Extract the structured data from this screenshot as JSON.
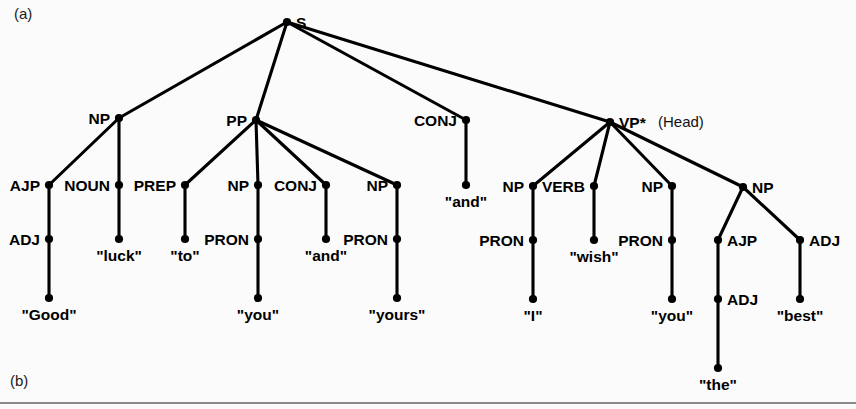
{
  "figure": {
    "panel_a_label": "(a)",
    "panel_b_label": "(b)",
    "head_annotation": "(Head)"
  },
  "tree": {
    "root": {
      "label": "S",
      "x": 287,
      "y": 22,
      "label_dx": 12,
      "label_dy": 1
    },
    "nodes": [
      {
        "id": "s",
        "label": "S",
        "x": 287,
        "y": 22,
        "side": "right"
      },
      {
        "id": "np1",
        "label": "NP",
        "x": 119,
        "y": 118,
        "side": "left"
      },
      {
        "id": "pp",
        "label": "PP",
        "x": 256,
        "y": 120,
        "side": "left"
      },
      {
        "id": "conj1",
        "label": "CONJ",
        "x": 466,
        "y": 120,
        "side": "left"
      },
      {
        "id": "vp",
        "label": "VP*",
        "x": 610,
        "y": 122,
        "side": "right"
      },
      {
        "id": "ajp1",
        "label": "AJP",
        "x": 49,
        "y": 185,
        "side": "left"
      },
      {
        "id": "noun1",
        "label": "NOUN",
        "x": 119,
        "y": 185,
        "side": "left"
      },
      {
        "id": "prep1",
        "label": "PREP",
        "x": 185,
        "y": 185,
        "side": "left"
      },
      {
        "id": "np2",
        "label": "NP",
        "x": 258,
        "y": 185,
        "side": "left"
      },
      {
        "id": "conj2",
        "label": "CONJ",
        "x": 326,
        "y": 185,
        "side": "left"
      },
      {
        "id": "np3",
        "label": "NP",
        "x": 397,
        "y": 185,
        "side": "left"
      },
      {
        "id": "np4",
        "label": "NP",
        "x": 533,
        "y": 186,
        "side": "left"
      },
      {
        "id": "verb1",
        "label": "VERB",
        "x": 594,
        "y": 186,
        "side": "left"
      },
      {
        "id": "np5",
        "label": "NP",
        "x": 672,
        "y": 186,
        "side": "left"
      },
      {
        "id": "np6",
        "label": "NP",
        "x": 743,
        "y": 187,
        "side": "right"
      },
      {
        "id": "adj1",
        "label": "ADJ",
        "x": 49,
        "y": 239,
        "side": "left"
      },
      {
        "id": "pron1",
        "label": "PRON",
        "x": 258,
        "y": 239,
        "side": "left"
      },
      {
        "id": "pron2",
        "label": "PRON",
        "x": 397,
        "y": 239,
        "side": "left"
      },
      {
        "id": "pron3",
        "label": "PRON",
        "x": 533,
        "y": 240,
        "side": "left"
      },
      {
        "id": "pron4",
        "label": "PRON",
        "x": 672,
        "y": 240,
        "side": "left"
      },
      {
        "id": "ajp2",
        "label": "AJP",
        "x": 718,
        "y": 240,
        "side": "right"
      },
      {
        "id": "adj2",
        "label": "ADJ",
        "x": 800,
        "y": 240,
        "side": "right"
      },
      {
        "id": "adj3",
        "label": "ADJ",
        "x": 718,
        "y": 299,
        "side": "right"
      }
    ],
    "leaves": [
      {
        "id": "w_good",
        "text": "\"Good\"",
        "x": 49,
        "y": 298,
        "label_dy": 22
      },
      {
        "id": "w_luck",
        "text": "\"luck\"",
        "x": 119,
        "y": 239,
        "label_dy": 22
      },
      {
        "id": "w_to",
        "text": "\"to\"",
        "x": 185,
        "y": 239,
        "label_dy": 22
      },
      {
        "id": "w_you1",
        "text": "\"you\"",
        "x": 258,
        "y": 298,
        "label_dy": 22
      },
      {
        "id": "w_and1",
        "text": "\"and\"",
        "x": 326,
        "y": 239,
        "label_dy": 22
      },
      {
        "id": "w_yours",
        "text": "\"yours\"",
        "x": 397,
        "y": 298,
        "label_dy": 22
      },
      {
        "id": "w_and2",
        "text": "\"and\"",
        "x": 466,
        "y": 185,
        "label_dy": 22
      },
      {
        "id": "w_i",
        "text": "\"I\"",
        "x": 533,
        "y": 299,
        "label_dy": 22
      },
      {
        "id": "w_wish",
        "text": "\"wish\"",
        "x": 594,
        "y": 240,
        "label_dy": 22
      },
      {
        "id": "w_you2",
        "text": "\"you\"",
        "x": 672,
        "y": 299,
        "label_dy": 22
      },
      {
        "id": "w_best",
        "text": "\"best\"",
        "x": 800,
        "y": 299,
        "label_dy": 22
      },
      {
        "id": "w_the",
        "text": "\"the\"",
        "x": 718,
        "y": 368,
        "label_dy": 22
      }
    ],
    "edges": [
      {
        "from": "s",
        "to": "np1"
      },
      {
        "from": "s",
        "to": "pp"
      },
      {
        "from": "s",
        "to": "conj1"
      },
      {
        "from": "s",
        "to": "vp"
      },
      {
        "from": "np1",
        "to": "ajp1"
      },
      {
        "from": "np1",
        "to": "noun1"
      },
      {
        "from": "pp",
        "to": "prep1"
      },
      {
        "from": "pp",
        "to": "np2"
      },
      {
        "from": "pp",
        "to": "conj2"
      },
      {
        "from": "pp",
        "to": "np3"
      },
      {
        "from": "conj1",
        "to": "w_and2"
      },
      {
        "from": "vp",
        "to": "np4"
      },
      {
        "from": "vp",
        "to": "verb1"
      },
      {
        "from": "vp",
        "to": "np5"
      },
      {
        "from": "vp",
        "to": "np6"
      },
      {
        "from": "ajp1",
        "to": "adj1"
      },
      {
        "from": "noun1",
        "to": "w_luck"
      },
      {
        "from": "prep1",
        "to": "w_to"
      },
      {
        "from": "np2",
        "to": "pron1"
      },
      {
        "from": "conj2",
        "to": "w_and1"
      },
      {
        "from": "np3",
        "to": "pron2"
      },
      {
        "from": "np4",
        "to": "pron3"
      },
      {
        "from": "verb1",
        "to": "w_wish"
      },
      {
        "from": "np5",
        "to": "pron4"
      },
      {
        "from": "np6",
        "to": "ajp2"
      },
      {
        "from": "np6",
        "to": "adj2"
      },
      {
        "from": "adj1",
        "to": "w_good"
      },
      {
        "from": "pron1",
        "to": "w_you1"
      },
      {
        "from": "pron2",
        "to": "w_yours"
      },
      {
        "from": "pron3",
        "to": "w_i"
      },
      {
        "from": "pron4",
        "to": "w_you2"
      },
      {
        "from": "ajp2",
        "to": "adj3"
      },
      {
        "from": "adj3",
        "to": "w_the"
      },
      {
        "from": "adj2",
        "to": "w_best"
      }
    ],
    "sentence": "Good luck to you and yours and I wish you the best"
  },
  "style": {
    "line_color": "#000000",
    "text_color": "#000000",
    "background": "#fbfbfb",
    "rule_color": "#8a8a8a"
  }
}
